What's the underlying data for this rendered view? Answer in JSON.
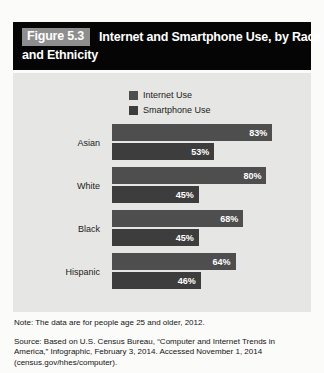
{
  "figure": {
    "number_label": "Figure 5.3",
    "title_line1": "Internet and Smartphone Use, by Race",
    "title_line2": "and Ethnicity"
  },
  "legend": {
    "items": [
      {
        "label": "Internet Use",
        "color": "#4e4e4e"
      },
      {
        "label": "Smartphone Use",
        "color": "#3d3d3d"
      }
    ]
  },
  "notes": {
    "note": "Note: The data are for people age 25 and older, 2012.",
    "source": "Source: Based on U.S. Census Bureau, “Computer and Internet Trends in America,” Infographic, February 3, 2014. Accessed November 1, 2014 (census.gov/hhes/computer)."
  },
  "colors": {
    "panel_background": "#e6e6e4",
    "title_background": "#050505",
    "figure_number_background": "#8e8e8e",
    "internet_bar": "#4e4e4e",
    "smartphone_bar": "#3d3d3d"
  },
  "chart_data": {
    "type": "bar",
    "orientation": "horizontal",
    "title": "Internet and Smartphone Use, by Race and Ethnicity",
    "xlabel": "",
    "ylabel": "",
    "xlim": [
      0,
      100
    ],
    "grid": false,
    "legend_position": "top-center",
    "categories": [
      "Asian",
      "White",
      "Black",
      "Hispanic"
    ],
    "series": [
      {
        "name": "Internet Use",
        "color": "#4e4e4e",
        "values": [
          83,
          80,
          68,
          64
        ],
        "labels": [
          "83%",
          "80%",
          "68%",
          "64%"
        ]
      },
      {
        "name": "Smartphone Use",
        "color": "#3d3d3d",
        "values": [
          53,
          45,
          45,
          46
        ],
        "labels": [
          "53%",
          "45%",
          "45%",
          "46%"
        ]
      }
    ]
  }
}
